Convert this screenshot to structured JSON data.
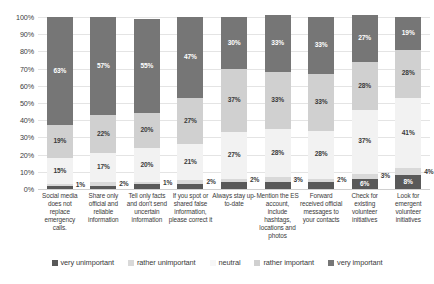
{
  "chart_data": {
    "type": "bar",
    "subtype": "stacked-bar-100-percent",
    "title": "",
    "xlabel": "",
    "ylabel": "",
    "ylim": [
      0,
      100
    ],
    "grid": true,
    "legend_position": "bottom",
    "y_ticks": [
      "0%",
      "10%",
      "20%",
      "30%",
      "40%",
      "50%",
      "60%",
      "70%",
      "80%",
      "90%",
      "100%"
    ],
    "categories": [
      "Social media does not replace emergency calls.",
      "Share only official and reliable information",
      "Tell only facts and don't send uncertain information",
      "If you spot or shared false information, please correct it",
      "Always stay up-to-date",
      "Mention the ES account, include hashtags, locations and photos",
      "Forward received official messages to your contacts",
      "Check for existing volunteer initiatives",
      "Look for emergent volunteer initiatives"
    ],
    "series": [
      {
        "name": "very unimportant",
        "color": "#595959",
        "values": [
          2,
          2,
          3,
          3,
          4,
          4,
          4,
          6,
          8
        ]
      },
      {
        "name": "rather unimportant",
        "color": "#d9d9d9",
        "values": [
          1,
          2,
          1,
          2,
          2,
          3,
          2,
          3,
          4
        ]
      },
      {
        "name": "neutral",
        "color": "#f2f2f2",
        "values": [
          15,
          17,
          20,
          21,
          27,
          28,
          28,
          37,
          41
        ]
      },
      {
        "name": "rather important",
        "color": "#d0d0d0",
        "values": [
          19,
          22,
          20,
          27,
          37,
          33,
          33,
          28,
          28
        ]
      },
      {
        "name": "very important",
        "color": "#767676",
        "values": [
          63,
          57,
          55,
          47,
          30,
          33,
          33,
          27,
          19
        ]
      }
    ],
    "data_labels": {
      "very unimportant": [
        "2%",
        "2%",
        "3%",
        "3%",
        "4%",
        "4%",
        "4%",
        "6%",
        "8%"
      ],
      "rather unimportant": [
        "1%",
        "2%",
        "1%",
        "2%",
        "2%",
        "3%",
        "2%",
        "3%",
        "4%"
      ],
      "neutral": [
        "15%",
        "17%",
        "20%",
        "21%",
        "27%",
        "28%",
        "28%",
        "37%",
        "41%"
      ],
      "rather important": [
        "19%",
        "22%",
        "20%",
        "27%",
        "37%",
        "33%",
        "33%",
        "28%",
        "28%"
      ],
      "very important": [
        "63%",
        "57%",
        "55%",
        "47%",
        "30%",
        "33%",
        "33%",
        "27%",
        "19%"
      ]
    }
  },
  "legend": {
    "items": [
      {
        "label": "very unimportant",
        "color": "#595959"
      },
      {
        "label": "rather unimportant",
        "color": "#d9d9d9"
      },
      {
        "label": "neutral",
        "color": "#f7f7f7"
      },
      {
        "label": "rather important",
        "color": "#d0d0d0"
      },
      {
        "label": "very important",
        "color": "#767676"
      }
    ]
  }
}
